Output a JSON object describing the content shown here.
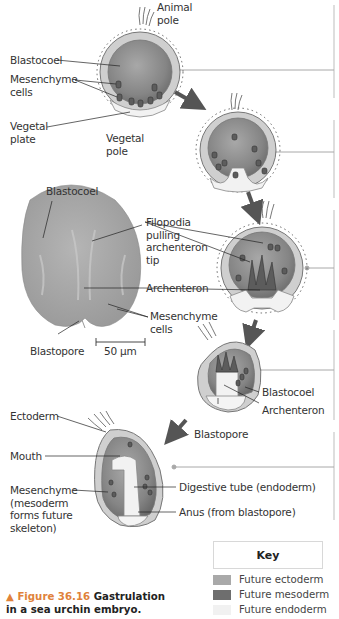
{
  "figure": {
    "number_label": "▲ Figure 36.16",
    "title_line1": "Gastrulation",
    "title_line2": "in a sea urchin embryo."
  },
  "labels": {
    "stage1": {
      "animal_pole": [
        "Animal",
        "pole"
      ],
      "blastocoel": "Blastocoel",
      "mesenchyme_cells": [
        "Mesenchyme",
        "cells"
      ],
      "vegetal_plate": [
        "Vegetal",
        "plate"
      ],
      "vegetal_pole": [
        "Vegetal",
        "pole"
      ]
    },
    "micrograph": {
      "blastocoel": "Blastocoel",
      "filopodia": [
        "Filopodia",
        "pulling",
        "archenteron",
        "tip"
      ],
      "archenteron": "Archenteron",
      "mesenchyme_cells": [
        "Mesenchyme",
        "cells"
      ],
      "blastopore": "Blastopore",
      "scale_bar": "50 μm"
    },
    "stage4": {
      "blastocoel": "Blastocoel",
      "archenteron": "Archenteron",
      "blastopore": "Blastopore"
    },
    "stage5": {
      "ectoderm": "Ectoderm",
      "mouth": "Mouth",
      "mesenchyme": [
        "Mesenchyme",
        "(mesoderm",
        "forms future",
        "skeleton)"
      ],
      "digestive_tube": "Digestive tube (endoderm)",
      "anus": "Anus (from blastopore)"
    }
  },
  "key": {
    "title": "Key",
    "items": [
      {
        "label": "Future ectoderm",
        "color": "#a9a9a9"
      },
      {
        "label": "Future mesoderm",
        "color": "#6e6e6e"
      },
      {
        "label": "Future endoderm",
        "color": "#f1f1f1"
      }
    ]
  },
  "colors": {
    "figure_number": "#e0823a",
    "arrow": "#555555",
    "leader": "#222222",
    "connector": "#9a9a9a"
  }
}
